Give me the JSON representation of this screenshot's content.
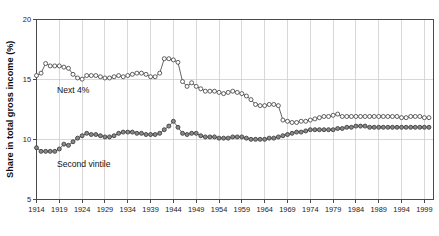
{
  "figure": {
    "title_fragment": "",
    "background": "#ffffff"
  },
  "axes": {
    "ylabel": "Share in total gross income (%)",
    "xlabel": "",
    "y_ticks": [
      "5",
      "10",
      "15",
      "20"
    ],
    "x_ticks": [
      "1914",
      "1919",
      "1924",
      "1929",
      "1934",
      "1939",
      "1944",
      "1949",
      "1954",
      "1959",
      "1964",
      "1969",
      "1974",
      "1979",
      "1984",
      "1989",
      "1994",
      "1999"
    ]
  },
  "annotations": {
    "upper_series_label": "Next 4%",
    "lower_series_label": "Second vintile"
  },
  "colors": {
    "axis": "#4a4a4a",
    "grid": "#c8c8c8",
    "line": "#555555",
    "marker_open_fill": "#ffffff",
    "marker_filled_fill": "#8a8a8a"
  },
  "chart_data": {
    "type": "line",
    "title": "",
    "xlabel": "",
    "ylabel": "Share in total gross income (%)",
    "xlim": [
      1914,
      2001
    ],
    "ylim": [
      5,
      20
    ],
    "y_tick_values": [
      5,
      10,
      15,
      20
    ],
    "x_tick_values": [
      1914,
      1919,
      1924,
      1929,
      1934,
      1939,
      1944,
      1949,
      1954,
      1959,
      1964,
      1969,
      1974,
      1979,
      1984,
      1989,
      1994,
      1999
    ],
    "grid": true,
    "legend": "inline-annotations",
    "x": [
      1914,
      1915,
      1916,
      1917,
      1918,
      1919,
      1920,
      1921,
      1922,
      1923,
      1924,
      1925,
      1926,
      1927,
      1928,
      1929,
      1930,
      1931,
      1932,
      1933,
      1934,
      1935,
      1936,
      1937,
      1938,
      1939,
      1940,
      1941,
      1942,
      1943,
      1944,
      1945,
      1946,
      1947,
      1948,
      1949,
      1950,
      1951,
      1952,
      1953,
      1954,
      1955,
      1956,
      1957,
      1958,
      1959,
      1960,
      1961,
      1962,
      1963,
      1964,
      1965,
      1966,
      1967,
      1968,
      1969,
      1970,
      1971,
      1972,
      1973,
      1974,
      1975,
      1976,
      1977,
      1978,
      1979,
      1980,
      1981,
      1982,
      1983,
      1984,
      1985,
      1986,
      1987,
      1988,
      1989,
      1990,
      1991,
      1992,
      1993,
      1994,
      1995,
      1996,
      1997,
      1998,
      1999,
      2000
    ],
    "series": [
      {
        "name": "Next 4%",
        "marker": "open-circle",
        "values": [
          15.3,
          15.5,
          16.3,
          16.1,
          16.1,
          16.1,
          16.0,
          15.9,
          15.4,
          15.1,
          15.0,
          15.3,
          15.3,
          15.3,
          15.2,
          15.1,
          15.1,
          15.2,
          15.3,
          15.2,
          15.3,
          15.4,
          15.5,
          15.5,
          15.4,
          15.2,
          15.2,
          15.5,
          16.7,
          16.7,
          16.6,
          16.4,
          14.8,
          14.4,
          14.7,
          14.4,
          14.2,
          14.0,
          14.0,
          14.0,
          13.9,
          13.8,
          13.9,
          14.0,
          13.9,
          13.8,
          13.6,
          13.3,
          12.9,
          12.8,
          12.8,
          12.9,
          12.9,
          12.8,
          11.6,
          11.5,
          11.4,
          11.4,
          11.5,
          11.5,
          11.6,
          11.7,
          11.8,
          11.9,
          11.9,
          12.0,
          12.1,
          11.9,
          11.9,
          11.9,
          11.9,
          11.9,
          11.9,
          11.9,
          11.9,
          11.9,
          11.9,
          11.9,
          11.9,
          11.9,
          11.8,
          11.8,
          11.9,
          11.9,
          11.9,
          11.8,
          11.8
        ]
      },
      {
        "name": "Second vintile",
        "marker": "filled-circle",
        "values": [
          9.3,
          9.0,
          9.0,
          9.0,
          9.0,
          9.2,
          9.6,
          9.5,
          9.8,
          10.1,
          10.3,
          10.5,
          10.4,
          10.4,
          10.3,
          10.2,
          10.2,
          10.3,
          10.5,
          10.6,
          10.6,
          10.6,
          10.5,
          10.5,
          10.4,
          10.4,
          10.4,
          10.5,
          10.8,
          11.1,
          11.5,
          11.0,
          10.5,
          10.4,
          10.5,
          10.5,
          10.3,
          10.2,
          10.2,
          10.2,
          10.1,
          10.1,
          10.1,
          10.2,
          10.2,
          10.2,
          10.1,
          10.0,
          10.0,
          10.0,
          10.0,
          10.1,
          10.1,
          10.2,
          10.3,
          10.4,
          10.5,
          10.6,
          10.6,
          10.7,
          10.8,
          10.8,
          10.8,
          10.8,
          10.8,
          10.8,
          10.9,
          10.9,
          11.0,
          11.0,
          11.1,
          11.1,
          11.1,
          11.0,
          11.0,
          11.0,
          11.0,
          11.0,
          11.0,
          11.0,
          11.0,
          11.0,
          11.0,
          11.0,
          11.0,
          11.0,
          11.0
        ]
      }
    ]
  }
}
